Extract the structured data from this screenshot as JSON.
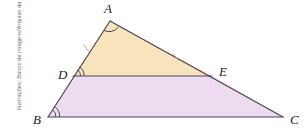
{
  "figure": {
    "type": "geometry-diagram",
    "credit": "Ilustrações: Banco de imagens/Arquivo da editora",
    "colors": {
      "upper_triangle_fill": "#f8e4bc",
      "lower_trapezoid_fill": "#eddcef",
      "stroke": "#4a4452",
      "label": "#1b1b1b",
      "credit": "#6d6d6d",
      "background": "#ffffff"
    },
    "vertices": [
      {
        "id": "A",
        "label": "A",
        "x": 110,
        "y": 21,
        "label_x": 104,
        "label_y": 13
      },
      {
        "id": "D",
        "label": "D",
        "x": 73,
        "y": 76,
        "label_x": 58,
        "label_y": 79
      },
      {
        "id": "E",
        "label": "E",
        "x": 212,
        "y": 76,
        "label_x": 219,
        "label_y": 76
      },
      {
        "id": "B",
        "label": "B",
        "x": 48,
        "y": 117,
        "label_x": 33,
        "label_y": 124
      },
      {
        "id": "C",
        "label": "C",
        "x": 283,
        "y": 117,
        "label_x": 290,
        "label_y": 124
      }
    ],
    "regions": [
      {
        "name": "triangle-ade",
        "points": "110,21 212,76 73,76",
        "fill": "#f8e4bc"
      },
      {
        "name": "trapezoid-dbce",
        "points": "73,76 212,76 283,117 48,117",
        "fill": "#eddcef"
      }
    ],
    "segments": [
      {
        "name": "segment-ab",
        "x1": 110,
        "y1": 21,
        "x2": 48,
        "y2": 117
      },
      {
        "name": "segment-ac",
        "x1": 110,
        "y1": 21,
        "x2": 283,
        "y2": 117
      },
      {
        "name": "segment-bc",
        "x1": 48,
        "y1": 117,
        "x2": 283,
        "y2": 117
      },
      {
        "name": "segment-de",
        "x1": 73,
        "y1": 76,
        "x2": 212,
        "y2": 76
      }
    ],
    "angle_marks": [
      {
        "name": "angle-arc-a",
        "vertex": "A",
        "arcs": 1
      },
      {
        "name": "angle-arc-d",
        "vertex": "D",
        "arcs": 2
      },
      {
        "name": "angle-arc-b",
        "vertex": "B",
        "arcs": 2
      }
    ],
    "tick_marks": [
      {
        "name": "tick-mark-ad",
        "x": 86,
        "y": 48
      },
      {
        "name": "tick-mark-ae",
        "x": 176,
        "y": 57
      }
    ]
  }
}
